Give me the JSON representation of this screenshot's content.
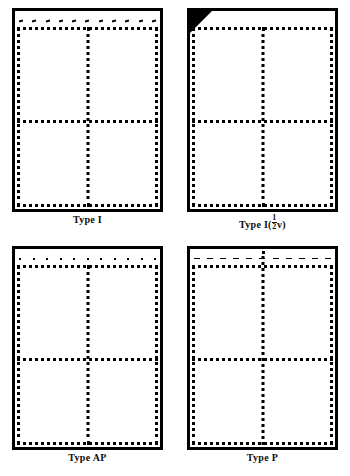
{
  "figure": {
    "panel_count": 4,
    "background_color": "#ffffff",
    "ink_color": "#000000",
    "layout": "2x2 grid"
  },
  "panels": [
    {
      "id": "type-i",
      "caption": "Type I",
      "caption_plain": "Type I",
      "has_corner_wedge": false,
      "tick_style": "slash",
      "tick_count": 11,
      "top_line_inset": true,
      "vertical_divider_from": "dotted-top",
      "horizontal_divider_position_pct": 55
    },
    {
      "id": "type-i-half-v",
      "caption_prefix": "Type I(",
      "caption_numerator": "1",
      "caption_denominator": "2",
      "caption_suffix": "v)",
      "caption_plain": "Type I(½v)",
      "has_corner_wedge": true,
      "tick_style": "none",
      "tick_count": 0,
      "top_line_inset": true,
      "vertical_divider_from": "dotted-top",
      "horizontal_divider_position_pct": 55
    },
    {
      "id": "type-ap",
      "caption": "Type AP",
      "caption_plain": "Type AP",
      "has_corner_wedge": false,
      "tick_style": "dot",
      "tick_count": 11,
      "top_line_inset": true,
      "vertical_divider_from": "dotted-top",
      "horizontal_divider_position_pct": 55
    },
    {
      "id": "type-p",
      "caption": "Type P",
      "caption_plain": "Type P",
      "has_corner_wedge": false,
      "tick_style": "dash",
      "tick_count": 11,
      "top_line_inset": true,
      "vertical_divider_from": "frame-top",
      "horizontal_divider_position_pct": 55
    }
  ]
}
